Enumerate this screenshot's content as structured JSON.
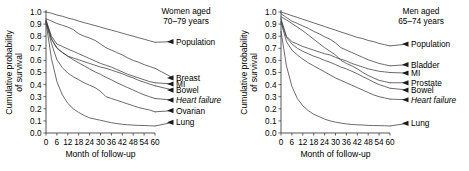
{
  "figure": {
    "x_axis_label": "Month of follow-up",
    "y_axis_label_line1": "Cumulative probability",
    "y_axis_label_line2": "of survival"
  },
  "chart_data": [
    {
      "type": "line",
      "panel": "women",
      "title_line1": "Women aged",
      "title_line2": "70–79 years",
      "xlabel": "Month of follow-up",
      "ylabel": "Cumulative probability of survival",
      "xlim": [
        0,
        60
      ],
      "ylim": [
        0.0,
        1.0
      ],
      "xticks": [
        0,
        6,
        12,
        18,
        24,
        30,
        36,
        42,
        48,
        54,
        60
      ],
      "xticklabels": [
        "0",
        "6",
        "12",
        "18",
        "24",
        "30",
        "36",
        "42",
        "48",
        "54",
        "60"
      ],
      "yticks": [
        0.0,
        0.1,
        0.2,
        0.3,
        0.4,
        0.5,
        0.6,
        0.7,
        0.8,
        0.9,
        1.0
      ],
      "yticklabels": [
        "0.0",
        "0.1",
        "0.2",
        "0.3",
        "0.4",
        "0.5",
        "0.6",
        "0.7",
        "0.8",
        "0.9",
        "1.0"
      ],
      "grid": false,
      "legend_position": "right-inline-arrows",
      "x": [
        0,
        3,
        6,
        9,
        12,
        15,
        18,
        21,
        24,
        27,
        30,
        33,
        36,
        39,
        42,
        45,
        48,
        51,
        54,
        57,
        60
      ],
      "series": [
        {
          "name": "Population",
          "label": "Population",
          "italic": false,
          "values": [
            1.0,
            0.99,
            0.975,
            0.965,
            0.95,
            0.94,
            0.925,
            0.912,
            0.9,
            0.888,
            0.875,
            0.862,
            0.85,
            0.838,
            0.825,
            0.812,
            0.8,
            0.787,
            0.775,
            0.762,
            0.75
          ]
        },
        {
          "name": "Breast",
          "label": "Breast",
          "italic": false,
          "values": [
            0.945,
            0.925,
            0.905,
            0.89,
            0.875,
            0.855,
            0.82,
            0.8,
            0.785,
            0.765,
            0.735,
            0.705,
            0.685,
            0.665,
            0.645,
            0.62,
            0.6,
            0.585,
            0.565,
            0.55,
            0.535
          ]
        },
        {
          "name": "MI",
          "label": "MI",
          "italic": false,
          "values": [
            0.935,
            0.8,
            0.735,
            0.715,
            0.695,
            0.675,
            0.655,
            0.635,
            0.615,
            0.595,
            0.575,
            0.56,
            0.545,
            0.525,
            0.505,
            0.485,
            0.47,
            0.455,
            0.44,
            0.425,
            0.415
          ]
        },
        {
          "name": "Bowel",
          "label": "Bowel",
          "italic": false,
          "values": [
            0.92,
            0.775,
            0.7,
            0.665,
            0.635,
            0.62,
            0.605,
            0.59,
            0.575,
            0.56,
            0.545,
            0.535,
            0.52,
            0.505,
            0.49,
            0.47,
            0.455,
            0.435,
            0.42,
            0.405,
            0.39
          ]
        },
        {
          "name": "Heart failure",
          "label": "Heart failure",
          "italic": true,
          "values": [
            0.93,
            0.78,
            0.705,
            0.665,
            0.635,
            0.605,
            0.58,
            0.555,
            0.53,
            0.505,
            0.485,
            0.46,
            0.44,
            0.415,
            0.395,
            0.375,
            0.355,
            0.335,
            0.315,
            0.3,
            0.285
          ]
        },
        {
          "name": "Ovarian",
          "label": "Ovarian",
          "italic": false,
          "values": [
            0.92,
            0.74,
            0.605,
            0.54,
            0.495,
            0.465,
            0.44,
            0.415,
            0.395,
            0.375,
            0.345,
            0.3,
            0.285,
            0.27,
            0.255,
            0.24,
            0.225,
            0.21,
            0.2,
            0.19,
            0.175
          ]
        },
        {
          "name": "Lung",
          "label": "Lung",
          "italic": false,
          "values": [
            0.915,
            0.615,
            0.425,
            0.315,
            0.245,
            0.2,
            0.17,
            0.145,
            0.125,
            0.115,
            0.105,
            0.095,
            0.085,
            0.078,
            0.072,
            0.068,
            0.065,
            0.063,
            0.062,
            0.06,
            0.058
          ]
        }
      ]
    },
    {
      "type": "line",
      "panel": "men",
      "title_line1": "Men aged",
      "title_line2": "65–74 years",
      "xlabel": "Month of follow-up",
      "ylabel": "Cumulative probability of survival",
      "xlim": [
        0,
        60
      ],
      "ylim": [
        0.0,
        1.0
      ],
      "xticks": [
        0,
        6,
        12,
        18,
        24,
        30,
        36,
        42,
        48,
        54,
        60
      ],
      "xticklabels": [
        "0",
        "6",
        "12",
        "18",
        "24",
        "30",
        "36",
        "42",
        "48",
        "54",
        "60"
      ],
      "yticks": [
        0.0,
        0.1,
        0.2,
        0.3,
        0.4,
        0.5,
        0.6,
        0.7,
        0.8,
        0.9,
        1.0
      ],
      "yticklabels": [
        "0.0",
        "0.1",
        "0.2",
        "0.3",
        "0.4",
        "0.5",
        "0.6",
        "0.7",
        "0.8",
        "0.9",
        "1.0"
      ],
      "grid": false,
      "legend_position": "right-inline-arrows",
      "x": [
        0,
        3,
        6,
        9,
        12,
        15,
        18,
        21,
        24,
        27,
        30,
        33,
        36,
        39,
        42,
        45,
        48,
        51,
        54,
        57,
        60
      ],
      "series": [
        {
          "name": "Population",
          "label": "Population",
          "italic": false,
          "values": [
            1.0,
            0.985,
            0.97,
            0.955,
            0.94,
            0.925,
            0.91,
            0.895,
            0.88,
            0.865,
            0.85,
            0.835,
            0.82,
            0.805,
            0.79,
            0.78,
            0.765,
            0.755,
            0.74,
            0.73,
            0.72
          ]
        },
        {
          "name": "Bladder",
          "label": "Bladder",
          "italic": false,
          "values": [
            0.985,
            0.955,
            0.925,
            0.905,
            0.885,
            0.865,
            0.84,
            0.82,
            0.795,
            0.775,
            0.745,
            0.705,
            0.685,
            0.665,
            0.645,
            0.625,
            0.605,
            0.59,
            0.575,
            0.565,
            0.555
          ]
        },
        {
          "name": "MI",
          "label": "MI",
          "italic": false,
          "values": [
            0.945,
            0.8,
            0.755,
            0.735,
            0.715,
            0.7,
            0.685,
            0.67,
            0.655,
            0.645,
            0.625,
            0.61,
            0.595,
            0.575,
            0.56,
            0.545,
            0.53,
            0.52,
            0.51,
            0.505,
            0.5
          ]
        },
        {
          "name": "Prostate",
          "label": "Prostate",
          "italic": false,
          "values": [
            0.96,
            0.935,
            0.905,
            0.875,
            0.845,
            0.81,
            0.775,
            0.74,
            0.705,
            0.675,
            0.645,
            0.6,
            0.575,
            0.555,
            0.53,
            0.5,
            0.475,
            0.455,
            0.435,
            0.425,
            0.415
          ]
        },
        {
          "name": "Bowel",
          "label": "Bowel",
          "italic": false,
          "values": [
            0.925,
            0.79,
            0.735,
            0.7,
            0.675,
            0.655,
            0.635,
            0.62,
            0.6,
            0.585,
            0.565,
            0.545,
            0.53,
            0.51,
            0.49,
            0.465,
            0.445,
            0.42,
            0.4,
            0.385,
            0.37
          ]
        },
        {
          "name": "Heart failure",
          "label": "Heart failure",
          "italic": true,
          "values": [
            0.915,
            0.755,
            0.685,
            0.645,
            0.61,
            0.58,
            0.555,
            0.53,
            0.505,
            0.48,
            0.455,
            0.435,
            0.415,
            0.395,
            0.375,
            0.355,
            0.335,
            0.315,
            0.3,
            0.29,
            0.28
          ]
        },
        {
          "name": "Lung",
          "label": "Lung",
          "italic": false,
          "values": [
            0.84,
            0.555,
            0.385,
            0.285,
            0.225,
            0.185,
            0.155,
            0.135,
            0.115,
            0.1,
            0.09,
            0.082,
            0.075,
            0.07,
            0.068,
            0.066,
            0.063,
            0.062,
            0.061,
            0.06,
            0.058
          ]
        }
      ]
    }
  ]
}
